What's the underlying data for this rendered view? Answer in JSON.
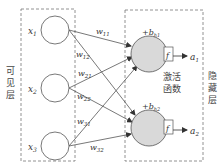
{
  "diagram": {
    "type": "neural-network",
    "visible_layer": {
      "label_chars": [
        "可",
        "见",
        "层"
      ],
      "nodes": [
        {
          "id": "x1",
          "label": "x",
          "sub": "1"
        },
        {
          "id": "x2",
          "label": "x",
          "sub": "2"
        },
        {
          "id": "x3",
          "label": "x",
          "sub": "3"
        }
      ]
    },
    "hidden_layer": {
      "label_chars": [
        "隐",
        "藏",
        "层"
      ],
      "nodes": [
        {
          "id": "h1",
          "bias": "+b",
          "bias_sub": "h1",
          "activation": "f",
          "output": "a",
          "output_sub": "1"
        },
        {
          "id": "h2",
          "bias": "+b",
          "bias_sub": "h2",
          "activation": "f",
          "output": "a",
          "output_sub": "2"
        }
      ],
      "activation_label_line1": "激活",
      "activation_label_line2": "函数"
    },
    "weights": [
      {
        "from": "x1",
        "to": "h1",
        "label": "w",
        "sub": "11"
      },
      {
        "from": "x1",
        "to": "h2",
        "label": "w",
        "sub": "12"
      },
      {
        "from": "x2",
        "to": "h1",
        "label": "w",
        "sub": "21"
      },
      {
        "from": "x2",
        "to": "h2",
        "label": "w",
        "sub": "22"
      },
      {
        "from": "x3",
        "to": "h1",
        "label": "w",
        "sub": "31"
      },
      {
        "from": "x3",
        "to": "h2",
        "label": "w",
        "sub": "32"
      }
    ],
    "colors": {
      "line": "#555555",
      "hidden_fill": "#d9d9d9",
      "dash": "#777777"
    }
  }
}
